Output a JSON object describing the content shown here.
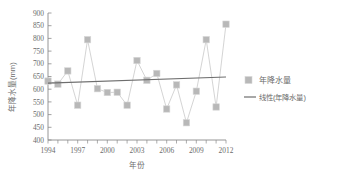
{
  "chart_data": {
    "type": "line",
    "title": "",
    "xlabel": "年份",
    "ylabel": "年降水量(mm)",
    "xlim": [
      1994,
      2012
    ],
    "ylim": [
      400,
      900
    ],
    "ytick_step": 50,
    "grid": false,
    "legend_position": "right",
    "x": [
      1994,
      1995,
      1996,
      1997,
      1998,
      1999,
      2000,
      2001,
      2002,
      2003,
      2004,
      2005,
      2006,
      2007,
      2008,
      2009,
      2010,
      2011,
      2012
    ],
    "xtick_labels": [
      "1994",
      "1997",
      "2000",
      "2003",
      "2006",
      "2009",
      "2012"
    ],
    "xtick_values": [
      1994,
      1997,
      2000,
      2003,
      2006,
      2009,
      2012
    ],
    "ytick_labels": [
      "400",
      "450",
      "500",
      "550",
      "600",
      "650",
      "700",
      "750",
      "800",
      "850",
      "900"
    ],
    "ytick_values": [
      400,
      450,
      500,
      550,
      600,
      650,
      700,
      750,
      800,
      850,
      900
    ],
    "series": [
      {
        "name": "年降水量",
        "marker": "square",
        "color": "#b8b8b8",
        "line_color": "#c9c9c9",
        "values": [
          632,
          620,
          672,
          537,
          795,
          602,
          587,
          588,
          537,
          713,
          635,
          662,
          522,
          617,
          468,
          592,
          795,
          530,
          856
        ]
      },
      {
        "name": "线性(年降水量)",
        "marker": "none",
        "color": "#6e6e6e",
        "type": "trend",
        "endpoints": [
          [
            1994,
            624
          ],
          [
            2012,
            648
          ]
        ]
      }
    ],
    "annotations": []
  },
  "legend": {
    "entries": [
      {
        "label": "年降水量",
        "swatch": "square-marker",
        "color": "#b8b8b8"
      },
      {
        "label": "线性(年降水量)",
        "swatch": "line-segment",
        "color": "#6e6e6e"
      }
    ]
  },
  "axes": {
    "y_title": "年降水量(mm)",
    "x_title": "年份"
  },
  "caption": {
    "text": ""
  }
}
